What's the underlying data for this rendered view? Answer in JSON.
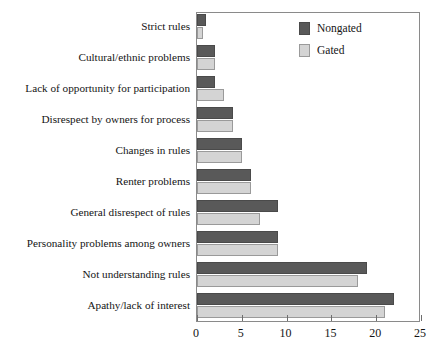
{
  "chart_data": {
    "type": "bar",
    "orientation": "horizontal",
    "title": "",
    "subtitle": "",
    "xlabel": "",
    "ylabel": "",
    "xlim": [
      0,
      25
    ],
    "xticks": [
      0,
      5,
      10,
      15,
      20,
      25
    ],
    "xtick_labels": [
      "0",
      "5",
      "10",
      "15",
      "20",
      "25"
    ],
    "grid": false,
    "legend_position": "top-right",
    "categories": [
      "Strict rules",
      "Cultural/ethnic problems",
      "Lack of opportunity for participation",
      "Disrespect by owners for process",
      "Changes in rules",
      "Renter problems",
      "General disrespect of rules",
      "Personality problems among owners",
      "Not understanding rules",
      "Apathy/lack of interest"
    ],
    "series": [
      {
        "name": "Nongated",
        "color": "#595959",
        "values": [
          1,
          2,
          2,
          4,
          5,
          6,
          9,
          9,
          19,
          22
        ]
      },
      {
        "name": "Gated",
        "color": "#d4d4d4",
        "values": [
          0.7,
          2,
          3,
          4,
          5,
          6,
          7,
          9,
          18,
          21
        ]
      }
    ]
  },
  "legend": {
    "entries": [
      {
        "label": "Nongated",
        "swatch": "nongated"
      },
      {
        "label": "Gated",
        "swatch": "gated"
      }
    ]
  }
}
